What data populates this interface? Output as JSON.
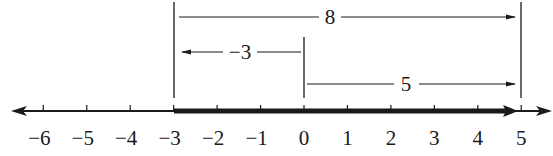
{
  "diagram": {
    "type": "number-line",
    "axis": {
      "min": -6,
      "max": 5,
      "tick_labels": [
        "−6",
        "−5",
        "−4",
        "−3",
        "−2",
        "−1",
        "0",
        "1",
        "2",
        "3",
        "4",
        "5"
      ],
      "highlighted_segment": {
        "from": -3,
        "to": 5
      }
    },
    "measures": [
      {
        "label": "8",
        "from": -3,
        "to": 5,
        "direction": "right"
      },
      {
        "label": "−3",
        "from": 0,
        "to": -3,
        "direction": "left"
      },
      {
        "label": "5",
        "from": 0,
        "to": 5,
        "direction": "right"
      }
    ],
    "colors": {
      "ink": "#1a1a1a",
      "background": "#ffffff"
    }
  }
}
